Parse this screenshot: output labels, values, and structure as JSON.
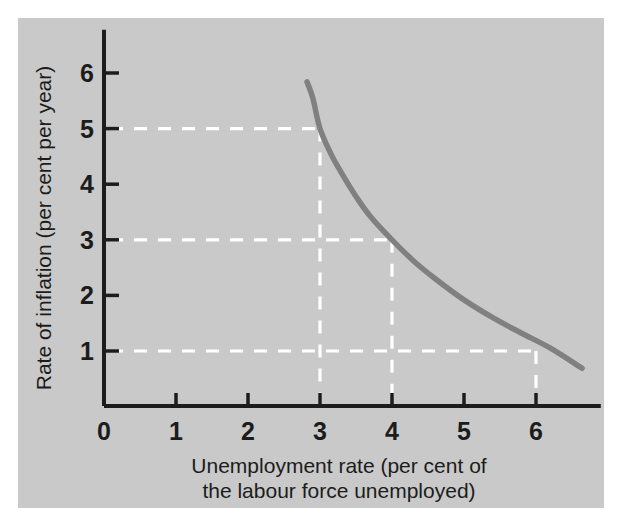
{
  "figure": {
    "background_color": "#ffffff",
    "panel_color": "#c9c9c9",
    "axis_color": "#1c1c1c",
    "curve_color": "#808080",
    "guide_color": "#ffffff"
  },
  "chart_data": {
    "type": "line",
    "title": "",
    "xlabel_line1": "Unemployment rate (per cent of",
    "xlabel_line2": "the labour force unemployed)",
    "ylabel": "Rate of inflation (per cent per year)",
    "xlim": [
      0,
      6.9
    ],
    "ylim": [
      0,
      6.6
    ],
    "xticks": [
      0,
      1,
      2,
      3,
      4,
      5,
      6
    ],
    "xticklabels": [
      "0",
      "1",
      "2",
      "3",
      "4",
      "5",
      "6"
    ],
    "yticks": [
      1,
      2,
      3,
      4,
      5,
      6
    ],
    "yticklabels": [
      "1",
      "2",
      "3",
      "4",
      "5",
      "6"
    ],
    "grid": false,
    "legend": false,
    "series": [
      {
        "name": "Phillips curve",
        "color": "#808080",
        "x": [
          2.82,
          2.9,
          3.0,
          3.15,
          3.3,
          3.5,
          3.7,
          4.0,
          4.3,
          4.6,
          5.0,
          5.4,
          5.8,
          6.2,
          6.64
        ],
        "y": [
          5.84,
          5.55,
          5.0,
          4.55,
          4.2,
          3.78,
          3.42,
          3.0,
          2.62,
          2.3,
          1.92,
          1.6,
          1.32,
          1.05,
          0.69
        ]
      }
    ],
    "annotations": [
      {
        "label": "point-3-5",
        "x": 3,
        "y": 5,
        "guides": [
          "horizontal",
          "vertical"
        ]
      },
      {
        "label": "point-4-3",
        "x": 4,
        "y": 3,
        "guides": [
          "horizontal",
          "vertical"
        ]
      },
      {
        "label": "point-6-1",
        "x": 6,
        "y": 1,
        "guides": [
          "horizontal",
          "vertical"
        ]
      }
    ]
  }
}
